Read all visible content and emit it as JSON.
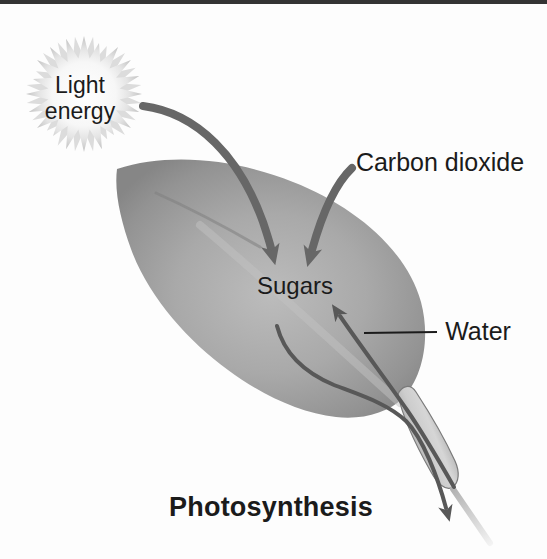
{
  "figure": {
    "type": "process-diagram",
    "topic": "Photosynthesis"
  },
  "labels": {
    "light_energy": {
      "line1": "Light",
      "line2": "energy"
    },
    "carbon_dioxide": "Carbon dioxide",
    "sugars": "Sugars",
    "water": "Water",
    "caption": "Photosynthesis"
  },
  "arrows": [
    {
      "name": "light-energy-arrow",
      "from": "Light energy",
      "to": "Sugars"
    },
    {
      "name": "carbon-dioxide-arrow",
      "from": "Carbon dioxide",
      "to": "Sugars"
    },
    {
      "name": "water-arrow",
      "from": "leaf stem",
      "to": "Sugars"
    },
    {
      "name": "sugar-export-arrow",
      "from": "Sugars",
      "to": "out through leaf stem"
    }
  ],
  "icons": {
    "light_burst": "starburst-icon",
    "leaf": "leaf-shape",
    "stem": "leaf-stem"
  },
  "colors": {
    "background": "#fdfdfd",
    "top_rule": "#343434",
    "text": "#1b1b1b",
    "leaf_center": "#bcbcbc",
    "leaf_edge": "#868686",
    "arrow_thick": "#676767",
    "arrow_thin": "#585858",
    "stem_highlight": "#d6d6d6",
    "stem_edge": "#8c8c8c",
    "burst_center": "#ffffff",
    "burst_spikes": "#c2c2c2"
  }
}
